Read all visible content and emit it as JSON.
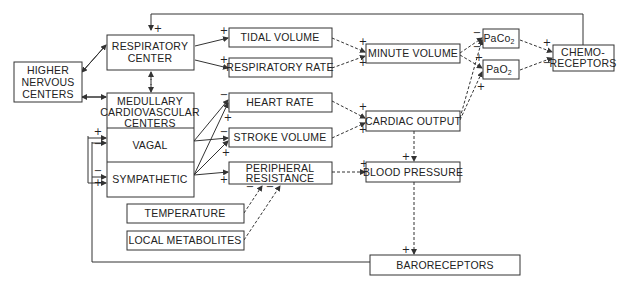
{
  "diagram": {
    "nodes": {
      "higher_nervous_centers": [
        "HIGHER",
        "NERVOUS",
        "CENTERS"
      ],
      "respiratory_center": [
        "RESPIRATORY",
        "CENTER"
      ],
      "medullary_cardiovascular_centers": [
        "MEDULLARY",
        "CARDIOVASCULAR",
        "CENTERS"
      ],
      "vagal": "VAGAL",
      "sympathetic": "SYMPATHETIC",
      "tidal_volume": "TIDAL VOLUME",
      "respiratory_rate": "RESPIRATORY RATE",
      "heart_rate": "HEART RATE",
      "stroke_volume": "STROKE VOLUME",
      "peripheral_resistance": [
        "PERIPHERAL",
        "RESISTANCE"
      ],
      "temperature": "TEMPERATURE",
      "local_metabolites": "LOCAL METABOLITES",
      "minute_volume": "MINUTE VOLUME",
      "cardiac_output": "CARDIAC OUTPUT",
      "blood_pressure": "BLOOD PRESSURE",
      "paco2": {
        "main": "PaCo",
        "sub": "2"
      },
      "pao2": {
        "main": "PaO",
        "sub": "2"
      },
      "chemoreceptors": [
        "CHEMO-",
        "RECEPTORS"
      ],
      "baroreceptors": "BARORECEPTORS"
    },
    "signs": {
      "plus": "+",
      "minus": "−"
    }
  }
}
